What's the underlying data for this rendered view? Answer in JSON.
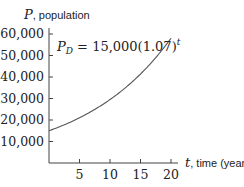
{
  "chart_data": {
    "type": "line",
    "title": "",
    "xlabel_var": "t",
    "xlabel_text": ", time (years)",
    "ylabel_var": "P",
    "ylabel_text": ", population",
    "annotation": {
      "lhs": "P",
      "lhs_sub": "D",
      "rhs": " = 15,000(1.07)",
      "exponent": "t"
    },
    "xlim": [
      0,
      21
    ],
    "ylim": [
      0,
      62000
    ],
    "grid": false,
    "x_ticks": [
      5,
      10,
      15,
      20
    ],
    "x_tick_labels": [
      "5",
      "10",
      "15",
      "20"
    ],
    "y_ticks": [
      10000,
      20000,
      30000,
      40000,
      50000,
      60000
    ],
    "y_tick_labels": [
      "10,000",
      "20,000",
      "30,000",
      "40,000",
      "50,000",
      "60,000"
    ],
    "series": [
      {
        "name": "P_D = 15,000(1.07)^t",
        "color": "#555555",
        "x": [
          0,
          2,
          4,
          6,
          8,
          10,
          12,
          14,
          16,
          18,
          20
        ],
        "values": [
          15000,
          17174,
          19662,
          22511,
          25773,
          29507,
          33783,
          38679,
          44284,
          50701,
          58045
        ]
      }
    ]
  }
}
